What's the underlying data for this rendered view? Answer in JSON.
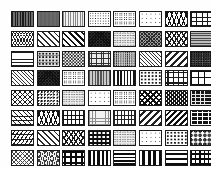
{
  "page": {
    "background_color": "#fefefe",
    "border_color": "#1a1a1a",
    "columns": 8,
    "rows": 8,
    "swatch_count": 64,
    "swatch_width_px": 23,
    "swatch_height_px": 16
  },
  "swatches": [
    {
      "index": 1,
      "row": 1,
      "col": 1,
      "name": "vertical-stripes-dark",
      "tone": "dark"
    },
    {
      "index": 2,
      "row": 1,
      "col": 2,
      "name": "solid-gray-fill",
      "tone": "medium"
    },
    {
      "index": 3,
      "row": 1,
      "col": 3,
      "name": "vertical-stripes-light",
      "tone": "light"
    },
    {
      "index": 4,
      "row": 1,
      "col": 4,
      "name": "fine-dot-grid",
      "tone": "light"
    },
    {
      "index": 5,
      "row": 1,
      "col": 5,
      "name": "open-circles",
      "tone": "light"
    },
    {
      "index": 6,
      "row": 1,
      "col": 6,
      "name": "sparse-dots",
      "tone": "light"
    },
    {
      "index": 7,
      "row": 1,
      "col": 7,
      "name": "zigzag-chevron",
      "tone": "medium"
    },
    {
      "index": 8,
      "row": 1,
      "col": 8,
      "name": "brick-light",
      "tone": "light"
    },
    {
      "index": 9,
      "row": 2,
      "col": 1,
      "name": "wavy-crosshatch",
      "tone": "medium"
    },
    {
      "index": 10,
      "row": 2,
      "col": 2,
      "name": "diagonal-stripes-light",
      "tone": "light"
    },
    {
      "index": 11,
      "row": 2,
      "col": 3,
      "name": "diagonal-stripes-bold",
      "tone": "dark"
    },
    {
      "index": 12,
      "row": 2,
      "col": 4,
      "name": "crosshatch-dense-dark",
      "tone": "dark"
    },
    {
      "index": 13,
      "row": 2,
      "col": 5,
      "name": "noise-light",
      "tone": "light"
    },
    {
      "index": 14,
      "row": 2,
      "col": 6,
      "name": "crosshatch-medium",
      "tone": "medium"
    },
    {
      "index": 15,
      "row": 2,
      "col": 7,
      "name": "chevron-open",
      "tone": "light"
    },
    {
      "index": 16,
      "row": 2,
      "col": 8,
      "name": "horizontal-lines-gray",
      "tone": "medium"
    },
    {
      "index": 17,
      "row": 3,
      "col": 1,
      "name": "horizontal-lines-thin",
      "tone": "light"
    },
    {
      "index": 18,
      "row": 3,
      "col": 2,
      "name": "dotted-grid",
      "tone": "light"
    },
    {
      "index": 19,
      "row": 3,
      "col": 3,
      "name": "checkerboard",
      "tone": "dark"
    },
    {
      "index": 20,
      "row": 3,
      "col": 4,
      "name": "fine-grid",
      "tone": "medium"
    },
    {
      "index": 21,
      "row": 3,
      "col": 5,
      "name": "noise-medium",
      "tone": "medium"
    },
    {
      "index": 22,
      "row": 3,
      "col": 6,
      "name": "diagonal-stripes-thin",
      "tone": "light"
    },
    {
      "index": 23,
      "row": 3,
      "col": 7,
      "name": "diagonal-stripes-band",
      "tone": "medium"
    },
    {
      "index": 24,
      "row": 3,
      "col": 8,
      "name": "noise-dark",
      "tone": "dark"
    },
    {
      "index": 25,
      "row": 4,
      "col": 1,
      "name": "diagonal-hatch-fine",
      "tone": "medium"
    },
    {
      "index": 26,
      "row": 4,
      "col": 2,
      "name": "crosshatch-dark",
      "tone": "dark"
    },
    {
      "index": 27,
      "row": 4,
      "col": 3,
      "name": "circles-open-sparse",
      "tone": "light"
    },
    {
      "index": 28,
      "row": 4,
      "col": 4,
      "name": "vertical-stripes-gray",
      "tone": "medium"
    },
    {
      "index": 29,
      "row": 4,
      "col": 5,
      "name": "vertical-stripes-bold",
      "tone": "dark"
    },
    {
      "index": 30,
      "row": 4,
      "col": 6,
      "name": "dot-pattern-rows",
      "tone": "light"
    },
    {
      "index": 31,
      "row": 4,
      "col": 7,
      "name": "plus-cross-grid",
      "tone": "medium"
    },
    {
      "index": 32,
      "row": 4,
      "col": 8,
      "name": "large-grid",
      "tone": "light"
    },
    {
      "index": 33,
      "row": 5,
      "col": 1,
      "name": "lattice-diagonal",
      "tone": "medium"
    },
    {
      "index": 34,
      "row": 5,
      "col": 2,
      "name": "speckled-texture",
      "tone": "medium"
    },
    {
      "index": 35,
      "row": 5,
      "col": 3,
      "name": "noise-very-light",
      "tone": "light"
    },
    {
      "index": 36,
      "row": 5,
      "col": 4,
      "name": "dots-sparse-open",
      "tone": "light"
    },
    {
      "index": 37,
      "row": 5,
      "col": 5,
      "name": "circle-grid",
      "tone": "medium"
    },
    {
      "index": 38,
      "row": 5,
      "col": 6,
      "name": "diamond-lattice",
      "tone": "dark"
    },
    {
      "index": 39,
      "row": 5,
      "col": 7,
      "name": "lattice-dense",
      "tone": "medium"
    },
    {
      "index": 40,
      "row": 5,
      "col": 8,
      "name": "block-dark",
      "tone": "dark"
    },
    {
      "index": 41,
      "row": 6,
      "col": 1,
      "name": "basket-weave",
      "tone": "medium"
    },
    {
      "index": 42,
      "row": 6,
      "col": 2,
      "name": "zigzag-wave",
      "tone": "light"
    },
    {
      "index": 43,
      "row": 6,
      "col": 3,
      "name": "brick-block",
      "tone": "dark"
    },
    {
      "index": 44,
      "row": 6,
      "col": 4,
      "name": "grid-light",
      "tone": "light"
    },
    {
      "index": 45,
      "row": 6,
      "col": 5,
      "name": "rectangle-grid",
      "tone": "light"
    },
    {
      "index": 46,
      "row": 6,
      "col": 6,
      "name": "diagonal-bands",
      "tone": "medium"
    },
    {
      "index": 47,
      "row": 6,
      "col": 7,
      "name": "diagonal-hatch-open",
      "tone": "light"
    },
    {
      "index": 48,
      "row": 6,
      "col": 8,
      "name": "brick-dark",
      "tone": "dark"
    },
    {
      "index": 49,
      "row": 7,
      "col": 1,
      "name": "weave-texture",
      "tone": "medium"
    },
    {
      "index": 50,
      "row": 7,
      "col": 2,
      "name": "diagonal-hatch-wide",
      "tone": "light"
    },
    {
      "index": 51,
      "row": 7,
      "col": 3,
      "name": "chain-zigzag-bands",
      "tone": "medium"
    },
    {
      "index": 52,
      "row": 7,
      "col": 4,
      "name": "circles-on-dark",
      "tone": "dark"
    },
    {
      "index": 53,
      "row": 7,
      "col": 5,
      "name": "texture-light",
      "tone": "light"
    },
    {
      "index": 54,
      "row": 7,
      "col": 6,
      "name": "dots-light",
      "tone": "light"
    },
    {
      "index": 55,
      "row": 7,
      "col": 7,
      "name": "dots-medium",
      "tone": "medium"
    },
    {
      "index": 56,
      "row": 7,
      "col": 8,
      "name": "diamond-grid-dark",
      "tone": "dark"
    },
    {
      "index": 57,
      "row": 8,
      "col": 1,
      "name": "crosshatch-light",
      "tone": "light"
    },
    {
      "index": 58,
      "row": 8,
      "col": 2,
      "name": "wavy-texture",
      "tone": "medium"
    },
    {
      "index": 59,
      "row": 8,
      "col": 3,
      "name": "plus-cross-dark",
      "tone": "dark"
    },
    {
      "index": 60,
      "row": 8,
      "col": 4,
      "name": "vertical-bars-bold",
      "tone": "dark"
    },
    {
      "index": 61,
      "row": 8,
      "col": 5,
      "name": "horizontal-bars-bold",
      "tone": "dark"
    },
    {
      "index": 62,
      "row": 8,
      "col": 6,
      "name": "vertical-bars-wide",
      "tone": "dark"
    },
    {
      "index": 63,
      "row": 8,
      "col": 7,
      "name": "horizontal-bars-thick",
      "tone": "dark"
    },
    {
      "index": 64,
      "row": 8,
      "col": 8,
      "name": "grid-with-bars",
      "tone": "dark"
    }
  ],
  "pattern_classes": [
    "p-vstripe-dark",
    "p-solid-gray",
    "p-vstripe-light",
    "p-dots-small",
    "p-circles",
    "p-dots-sparse",
    "p-zigzag",
    "p-brick",
    "p-wave",
    "p-diag-light",
    "p-diag-bold",
    "p-cross-dark",
    "p-noise-light",
    "p-cross-med",
    "p-chevron",
    "p-hline-gray",
    "p-hline-thin",
    "p-dots-grid",
    "p-checker",
    "p-grid-fine",
    "p-noise-med",
    "p-diag-hatch-fine",
    "p-diag-band",
    "p-noise-dark",
    "p-diag-hatch-fine",
    "p-cross-dark",
    "p-circles",
    "p-vstripe-gray",
    "p-vstripe-bold",
    "p-dots-med",
    "p-plus",
    "p-grid-large",
    "p-lattice",
    "p-speckle",
    "p-noise-light",
    "p-dots-sparse",
    "p-circles",
    "p-diamond-dark",
    "p-lattice-dense",
    "p-block-dark",
    "p-weave",
    "p-zigzag",
    "p-block",
    "p-grid-light",
    "p-grid-rect",
    "p-diag-band",
    "p-diag-rev",
    "p-brick-dark",
    "p-weave2",
    "p-diag-light",
    "p-chevron",
    "p-circles-dark",
    "p-noise-light",
    "p-dots-sparse",
    "p-dots-med",
    "p-diamond-solid",
    "p-cross-light",
    "p-wavy-texture",
    "p-plus-dark",
    "p-vbar-thick",
    "p-hbar-bold",
    "p-vbar-wide",
    "p-hbar-thick",
    "p-grid-bars"
  ]
}
